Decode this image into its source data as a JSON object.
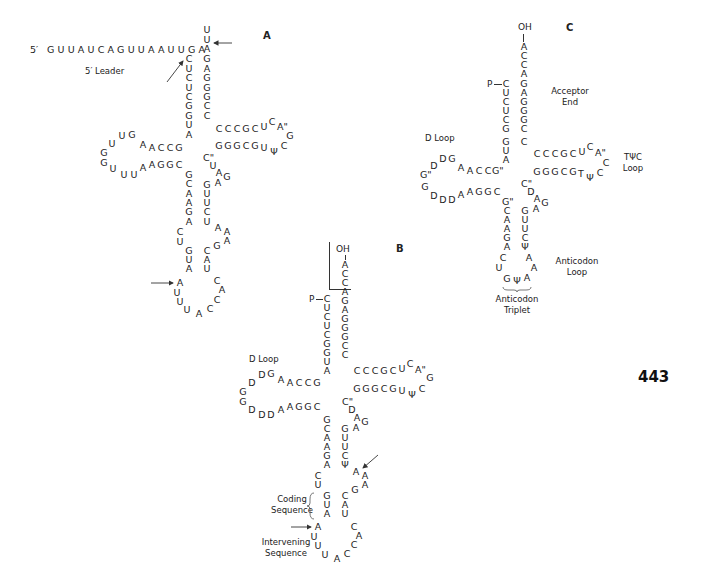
{
  "page_number": "443",
  "panels": {
    "A": {
      "letter": "A",
      "five_prime": "5′",
      "leader_sequence": "GUUAUCAGUUAAUUGA",
      "leader_label": "5′ Leader",
      "acceptor_left": [
        "C",
        "U",
        "C",
        "U",
        "C",
        "G",
        "G",
        "U",
        "A"
      ],
      "acceptor_right": [
        "U",
        "U",
        "A",
        "G",
        "A",
        "G",
        "G",
        "G",
        "C",
        "C"
      ],
      "d_arm_top": [
        "A",
        "C",
        "C",
        "G"
      ],
      "d_arm_bottom": [
        "A",
        "G",
        "G",
        "C"
      ],
      "d_loop": [
        "A",
        "G",
        "U",
        "U",
        "G",
        "G",
        "U",
        "U"
      ],
      "t_arm_top": [
        "C",
        "C",
        "C",
        "G",
        "C"
      ],
      "t_arm_bottom": [
        "G",
        "G",
        "G",
        "C",
        "G"
      ],
      "t_loop": [
        "U",
        "C",
        "A\"",
        "G",
        "C",
        "Ψ",
        "U"
      ],
      "variable": [
        "C\"",
        "U",
        "A",
        "G",
        "A"
      ],
      "anticodon_left": [
        "G",
        "C",
        "A",
        "A",
        "G",
        "A"
      ],
      "anticodon_right": [
        "G",
        "U",
        "U",
        "C",
        "U"
      ],
      "anticodon_loop_left": [
        "C",
        "U"
      ],
      "anticodon_loop_right": [
        "A",
        "A",
        "G"
      ],
      "intron_left_stem": [
        "G",
        "U",
        "A"
      ],
      "intron_right_stem": [
        "C",
        "A",
        "U"
      ],
      "intron_loop": [
        "A",
        "U",
        "U",
        "U",
        "A",
        "C",
        "C",
        "A",
        "C"
      ]
    },
    "B": {
      "letter": "B",
      "oh": "OH",
      "acceptor_3prime": [
        "A",
        "C",
        "C"
      ],
      "phosphate": "P",
      "acceptor_left": [
        "C",
        "U",
        "C",
        "U",
        "C",
        "G",
        "G",
        "U",
        "A"
      ],
      "acceptor_right": [
        "A",
        "G",
        "A",
        "G",
        "G",
        "G",
        "C",
        "C"
      ],
      "d_loop_label": "D Loop",
      "d_arm_top": [
        "A",
        "C",
        "C",
        "G"
      ],
      "d_arm_bottom": [
        "A",
        "G",
        "G",
        "C"
      ],
      "d_loop": [
        "D",
        "G",
        "D",
        "G",
        "G",
        "D",
        "D",
        "D"
      ],
      "t_arm_top": [
        "C",
        "C",
        "C",
        "G",
        "C"
      ],
      "t_arm_bottom": [
        "G",
        "G",
        "G",
        "C",
        "G"
      ],
      "t_loop": [
        "U",
        "C",
        "A\"",
        "G",
        "C",
        "Ψ",
        "U"
      ],
      "variable": [
        "C\"",
        "D",
        "A",
        "G",
        "A"
      ],
      "anticodon_left": [
        "G",
        "C",
        "A",
        "A",
        "G",
        "A"
      ],
      "anticodon_right": [
        "G",
        "U",
        "U",
        "C",
        "Ψ"
      ],
      "anticodon_loop_left": [
        "C",
        "U"
      ],
      "anticodon_loop_right": [
        "A",
        "A",
        "A",
        "G"
      ],
      "coding_left": [
        "G",
        "U",
        "A"
      ],
      "coding_right": [
        "C",
        "A",
        "U"
      ],
      "coding_label_1": "Coding",
      "coding_label_2": "Sequence",
      "intron_loop": [
        "A",
        "U",
        "U",
        "U",
        "A",
        "C",
        "C",
        "A",
        "C"
      ],
      "intervening_label_1": "Intervening",
      "intervening_label_2": "Sequence"
    },
    "C": {
      "letter": "C",
      "oh": "OH",
      "acceptor_3prime": [
        "A",
        "C",
        "C",
        "A"
      ],
      "phosphate": "P",
      "acceptor_left": [
        "C",
        "U",
        "C",
        "U",
        "C",
        "G",
        "G",
        "U",
        "A"
      ],
      "acceptor_right": [
        "G",
        "A",
        "G",
        "G",
        "G",
        "C",
        "C"
      ],
      "acceptor_label_1": "Acceptor",
      "acceptor_label_2": "End",
      "d_loop_label": "D Loop",
      "d_arm_top": [
        "A",
        "C",
        "C",
        "G\""
      ],
      "d_arm_bottom": [
        "A",
        "G",
        "G",
        "C"
      ],
      "d_loop": [
        "A",
        "G",
        "D",
        "D",
        "G\"",
        "G",
        "D",
        "D",
        "D"
      ],
      "t_arm_top": [
        "C",
        "C",
        "C",
        "G",
        "C"
      ],
      "t_arm_bottom": [
        "G",
        "G",
        "G",
        "C",
        "G"
      ],
      "t_loop": [
        "U",
        "C",
        "A\"",
        "C",
        "C",
        "Ψ",
        "T"
      ],
      "tpsic_label_1": "TΨC",
      "tpsic_label_2": "Loop",
      "variable": [
        "C\"",
        "D",
        "A",
        "G",
        "A"
      ],
      "anticodon_left": [
        "G\"",
        "C",
        "A",
        "A",
        "G",
        "A"
      ],
      "anticodon_right": [
        "G",
        "U",
        "U",
        "C",
        "Ψ"
      ],
      "anticodon_loop": [
        "C",
        "U",
        "G",
        "Ψ",
        "A",
        "A",
        "A"
      ],
      "anticodon_loop_label_1": "Anticodon",
      "anticodon_loop_label_2": "Loop",
      "anticodon_triplet_label_1": "Anticodon",
      "anticodon_triplet_label_2": "Triplet"
    }
  }
}
